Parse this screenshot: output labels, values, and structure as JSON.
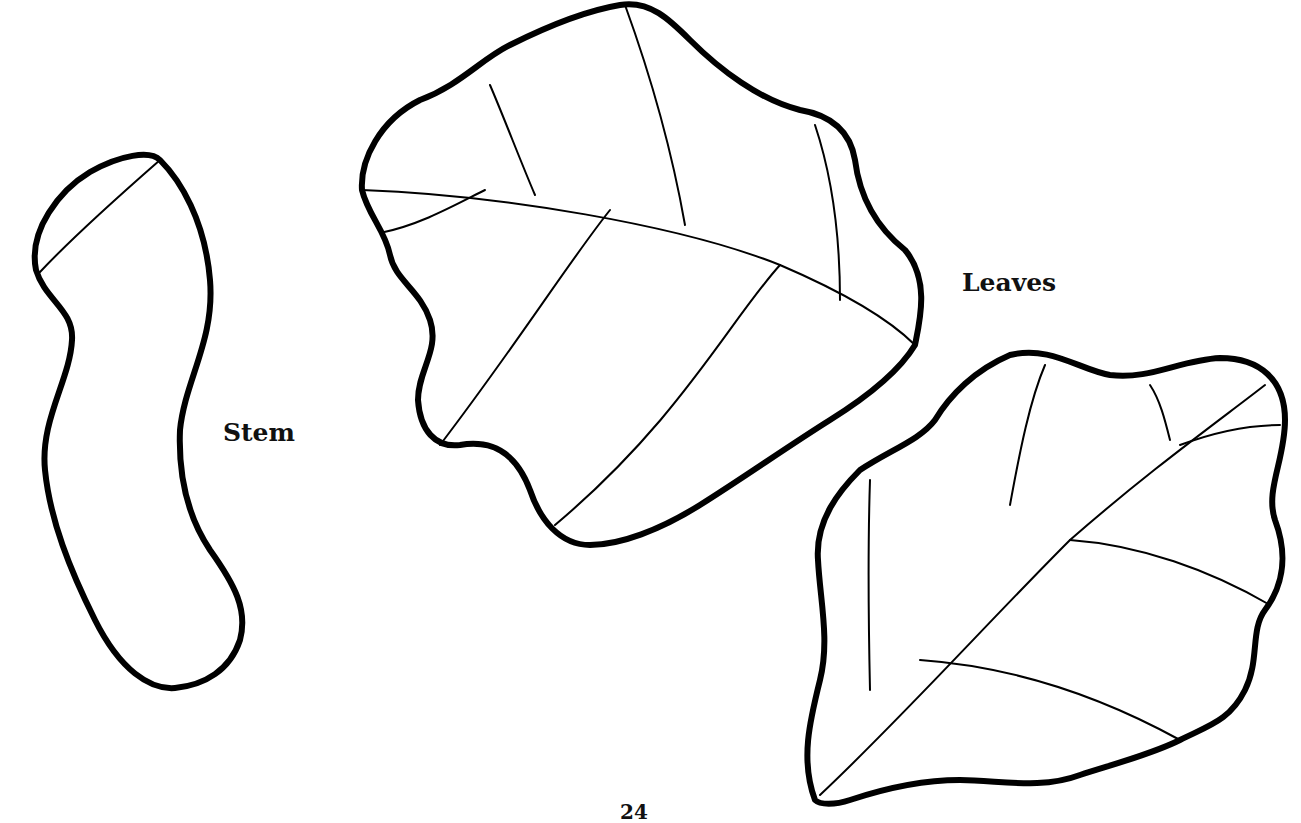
{
  "labels": {
    "stem": "Stem",
    "leaves": "Leaves",
    "page_number": "24"
  },
  "figures": [
    {
      "name": "stem",
      "type": "outline-drawing"
    },
    {
      "name": "leaf-top",
      "type": "outline-drawing"
    },
    {
      "name": "leaf-bottom",
      "type": "outline-drawing"
    }
  ],
  "colors": {
    "line": "#000000",
    "background": "#ffffff"
  }
}
